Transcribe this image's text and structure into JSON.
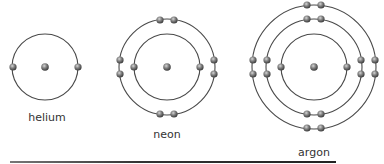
{
  "diagram": {
    "colors": {
      "orbit": "#4a4a4a",
      "electron_light": "#c8c8c8",
      "electron_mid": "#7a7a7a",
      "electron_dark": "#3a3a3a",
      "label": "#333333"
    },
    "atoms": [
      {
        "name": "helium",
        "label": "helium",
        "center": [
          45,
          67
        ],
        "label_pos": [
          47,
          118
        ],
        "shells": [
          {
            "radius": 33,
            "electrons": [
              [
                13,
                67
              ],
              [
                78,
                67
              ]
            ]
          }
        ]
      },
      {
        "name": "neon",
        "label": "neon",
        "center": [
          167,
          67
        ],
        "label_pos": [
          167,
          135
        ],
        "shells": [
          {
            "radius": 33,
            "electrons": [
              [
                134,
                67
              ],
              [
                200,
                67
              ]
            ]
          },
          {
            "radius": 48,
            "electrons": [
              [
                160,
                20
              ],
              [
                174,
                20
              ],
              [
                120,
                60
              ],
              [
                120,
                74
              ],
              [
                214,
                60
              ],
              [
                214,
                74
              ],
              [
                160,
                114
              ],
              [
                174,
                114
              ]
            ]
          }
        ]
      },
      {
        "name": "argon",
        "label": "argon",
        "center": [
          314,
          67
        ],
        "label_pos": [
          314,
          153
        ],
        "shells": [
          {
            "radius": 33,
            "electrons": [
              [
                281,
                67
              ],
              [
                347,
                67
              ]
            ]
          },
          {
            "radius": 48,
            "electrons": [
              [
                307,
                19
              ],
              [
                321,
                19
              ],
              [
                267,
                60
              ],
              [
                267,
                74
              ],
              [
                361,
                60
              ],
              [
                361,
                74
              ],
              [
                307,
                114
              ],
              [
                321,
                114
              ]
            ]
          },
          {
            "radius": 62,
            "electrons": [
              [
                307,
                5
              ],
              [
                321,
                5
              ],
              [
                253,
                60
              ],
              [
                253,
                74
              ],
              [
                375,
                60
              ],
              [
                375,
                74
              ],
              [
                307,
                128
              ],
              [
                321,
                128
              ]
            ]
          }
        ]
      }
    ],
    "baseline_rule": {
      "x1": 10,
      "x2": 336,
      "y": 162
    }
  }
}
